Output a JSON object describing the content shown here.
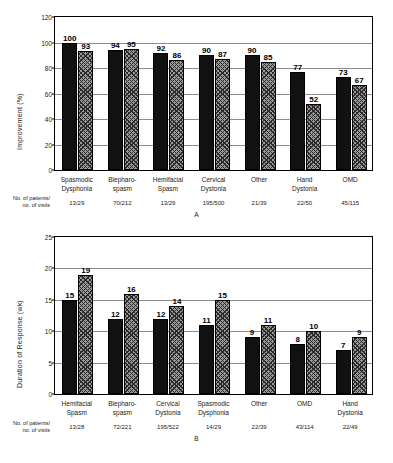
{
  "figure": {
    "counts_row_label": "No. of patients/\nno. of visits"
  },
  "chart_data": [
    {
      "type": "bar",
      "panel": "A",
      "title": "",
      "xlabel": "",
      "ylabel": "Improvement (%)",
      "ylim": [
        0,
        120
      ],
      "yticks": [
        0,
        20,
        40,
        60,
        80,
        100,
        120
      ],
      "grid": true,
      "legend": "none",
      "categories": [
        "Spasmodic\nDysphonia",
        "Blepharo-\nspasm",
        "Hemifacial\nSpasm",
        "Cervical\nDystonia",
        "Other",
        "Hand\nDystonia",
        "OMD"
      ],
      "series": [
        {
          "name": "black",
          "style": "solid",
          "values": [
            100,
            94,
            92,
            90,
            90,
            77,
            73
          ]
        },
        {
          "name": "hatched",
          "style": "hatch",
          "values": [
            93,
            95,
            86,
            87,
            85,
            52,
            67
          ]
        }
      ],
      "annotations": {
        "counts": [
          "13/29",
          "70/212",
          "13/29",
          "195/500",
          "21/39",
          "22/50",
          "45/115"
        ]
      }
    },
    {
      "type": "bar",
      "panel": "B",
      "title": "",
      "xlabel": "",
      "ylabel": "Duration of Response (wk)",
      "ylim": [
        0,
        25
      ],
      "yticks": [
        0,
        5,
        10,
        15,
        20,
        25
      ],
      "grid": true,
      "legend": "none",
      "categories": [
        "Hemifacial\nSpasm",
        "Blepharo-\nspasm",
        "Cervical\nDystonia",
        "Spasmodic\nDysphonia",
        "Other",
        "OMD",
        "Hand\nDystonia"
      ],
      "series": [
        {
          "name": "black",
          "style": "solid",
          "values": [
            15,
            12,
            12,
            11,
            9,
            8,
            7
          ]
        },
        {
          "name": "hatched",
          "style": "hatch",
          "values": [
            19,
            16,
            14,
            15,
            11,
            10,
            9
          ]
        }
      ],
      "annotations": {
        "counts": [
          "13/28",
          "72/221",
          "195/522",
          "14/29",
          "22/39",
          "43/114",
          "22/49"
        ]
      }
    }
  ]
}
